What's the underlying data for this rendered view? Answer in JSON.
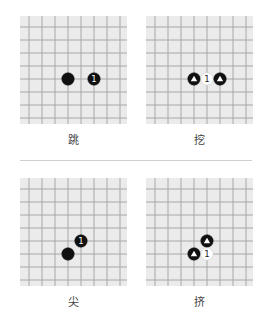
{
  "colors": {
    "board_bg": "#ebebeb",
    "grid_line": "#a8a8a8",
    "black_stone": "#111111",
    "white_stone": "#ffffff",
    "divider": "#d0d0d0"
  },
  "grid": {
    "lines": 8,
    "spacing": 13,
    "offset": 13
  },
  "diagrams": [
    {
      "label": "跳",
      "left": 20,
      "top": 16,
      "stones": [
        {
          "col": 3,
          "row": 4,
          "color": "black",
          "mark": ""
        },
        {
          "col": 5,
          "row": 4,
          "color": "black",
          "mark": "1"
        }
      ]
    },
    {
      "label": "挖",
      "left": 146,
      "top": 16,
      "stones": [
        {
          "col": 3,
          "row": 4,
          "color": "black",
          "mark": "triangle"
        },
        {
          "col": 4,
          "row": 4,
          "color": "white",
          "mark": "1"
        },
        {
          "col": 5,
          "row": 4,
          "color": "black",
          "mark": "triangle"
        }
      ]
    },
    {
      "label": "尖",
      "left": 20,
      "top": 178,
      "stones": [
        {
          "col": 4,
          "row": 4,
          "color": "black",
          "mark": "1"
        },
        {
          "col": 3,
          "row": 5,
          "color": "black",
          "mark": ""
        }
      ]
    },
    {
      "label": "挤",
      "left": 146,
      "top": 178,
      "stones": [
        {
          "col": 4,
          "row": 4,
          "color": "black",
          "mark": "triangle"
        },
        {
          "col": 3,
          "row": 5,
          "color": "black",
          "mark": "triangle"
        },
        {
          "col": 4,
          "row": 5,
          "color": "white",
          "mark": "1"
        }
      ]
    }
  ]
}
